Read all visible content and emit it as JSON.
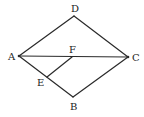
{
  "diagram": {
    "type": "geometry-figure",
    "points": {
      "A": {
        "label": "A",
        "x": 19,
        "y": 56,
        "label_x": 8,
        "label_y": 60
      },
      "B": {
        "label": "B",
        "x": 73,
        "y": 97,
        "label_x": 70,
        "label_y": 110
      },
      "C": {
        "label": "C",
        "x": 128,
        "y": 57,
        "label_x": 132,
        "label_y": 61
      },
      "D": {
        "label": "D",
        "x": 74,
        "y": 16,
        "label_x": 71,
        "label_y": 12
      },
      "E": {
        "label": "E",
        "x": 47,
        "y": 77,
        "label_x": 37,
        "label_y": 86
      },
      "F": {
        "label": "F",
        "x": 72,
        "y": 57,
        "label_x": 69,
        "label_y": 53
      }
    },
    "segments": [
      {
        "from": "A",
        "to": "D"
      },
      {
        "from": "D",
        "to": "C"
      },
      {
        "from": "C",
        "to": "B"
      },
      {
        "from": "B",
        "to": "A"
      },
      {
        "from": "A",
        "to": "C"
      },
      {
        "from": "E",
        "to": "F"
      }
    ],
    "labels": [
      "A",
      "B",
      "C",
      "D",
      "E",
      "F"
    ]
  }
}
